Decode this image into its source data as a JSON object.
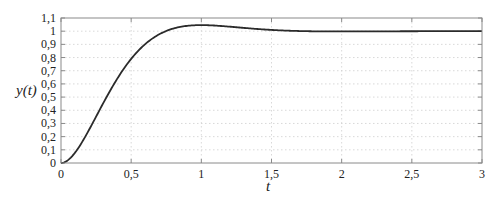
{
  "chart_data": {
    "type": "line",
    "title": "",
    "xlabel": "t",
    "ylabel": "y(t)",
    "xlim": [
      0,
      3
    ],
    "ylim": [
      0,
      1.1
    ],
    "grid": true,
    "legend": null,
    "x_ticks": [
      "0",
      "0,5",
      "1",
      "1,5",
      "2",
      "2,5",
      "3"
    ],
    "x_tick_values": [
      0,
      0.5,
      1,
      1.5,
      2,
      2.5,
      3
    ],
    "y_ticks": [
      "0",
      "0,1",
      "0,2",
      "0,3",
      "0,4",
      "0,5",
      "0,6",
      "0,7",
      "0,8",
      "0,9",
      "1",
      "1,1"
    ],
    "y_tick_values": [
      0,
      0.1,
      0.2,
      0.3,
      0.4,
      0.5,
      0.6,
      0.7,
      0.8,
      0.9,
      1.0,
      1.1
    ],
    "series": [
      {
        "name": "y(t)",
        "color": "#2b2b2b",
        "x": [
          0,
          0.1,
          0.2,
          0.3,
          0.4,
          0.5,
          0.6,
          0.7,
          0.8,
          0.9,
          1.0,
          1.1,
          1.2,
          1.4,
          1.6,
          1.8,
          2.0,
          2.5,
          3.0
        ],
        "y": [
          0,
          0.08,
          0.25,
          0.44,
          0.62,
          0.77,
          0.88,
          0.96,
          1.01,
          1.035,
          1.043,
          1.04,
          1.033,
          1.015,
          1.004,
          0.999,
          0.998,
          1.0,
          1.0
        ]
      }
    ]
  },
  "labels": {
    "ylabel": "y(t)",
    "xlabel": "t"
  }
}
